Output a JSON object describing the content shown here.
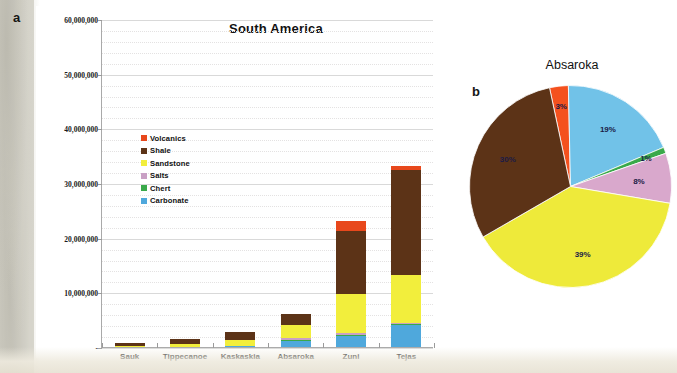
{
  "panels": {
    "a_letter": "a",
    "b_letter": "b"
  },
  "bar_panel": {
    "title": "South America",
    "legend_title": "",
    "legend": [
      {
        "label": "Volcanics",
        "color": "#e8481c"
      },
      {
        "label": "Shale",
        "color": "#5c3317"
      },
      {
        "label": "Sandstone",
        "color": "#f2ee3c"
      },
      {
        "label": "Salts",
        "color": "#c9a0c4"
      },
      {
        "label": "Chert",
        "color": "#3aa94a"
      },
      {
        "label": "Carbonate",
        "color": "#4fa8dc"
      }
    ]
  },
  "pie_panel": {
    "title": "Absaroka"
  },
  "chart_data": [
    {
      "type": "bar",
      "title": "South America",
      "stacked": true,
      "xlabel": "",
      "ylabel": "",
      "ylim": [
        0,
        60000000
      ],
      "ytick_values": [
        0,
        10000000,
        20000000,
        30000000,
        40000000,
        50000000,
        60000000
      ],
      "ytick_labels": [
        "-",
        "10,000,000",
        "20,000,000",
        "30,000,000",
        "40,000,000",
        "50,000,000",
        "60,000,000"
      ],
      "grid": true,
      "legend_position": "inside-upper-left",
      "categories": [
        "Sauk",
        "Tippecanoe",
        "Kaskaskia",
        "Absaroka",
        "Zuni",
        "Tejas"
      ],
      "series": [
        {
          "name": "Carbonate",
          "color": "#4fa8dc",
          "values": [
            0,
            0,
            200000,
            1100000,
            2000000,
            4000000
          ]
        },
        {
          "name": "Chert",
          "color": "#3aa94a",
          "values": [
            0,
            0,
            0,
            50000,
            80000,
            80000
          ]
        },
        {
          "name": "Salts",
          "color": "#c9a0c4",
          "values": [
            0,
            0,
            0,
            350000,
            500000,
            200000
          ]
        },
        {
          "name": "Sandstone",
          "color": "#f2ee3c",
          "values": [
            100000,
            600000,
            1100000,
            2400000,
            7000000,
            8900000
          ]
        },
        {
          "name": "Shale",
          "color": "#5c3317",
          "values": [
            600000,
            800000,
            1400000,
            2100000,
            11600000,
            19200000
          ]
        },
        {
          "name": "Volcanics",
          "color": "#e8481c",
          "values": [
            0,
            0,
            0,
            0,
            1800000,
            600000
          ]
        }
      ]
    },
    {
      "type": "pie",
      "title": "Absaroka",
      "labels": [
        "Volcanics",
        "Carbonate",
        "Chert",
        "Salts",
        "Sandstone",
        "Shale"
      ],
      "values": [
        3,
        19,
        1,
        8,
        39,
        30
      ],
      "display_labels": [
        "3%",
        "19%",
        "1%",
        "8%",
        "39%",
        "30%"
      ],
      "colors": [
        "#f4511e",
        "#71c2e8",
        "#3aa94a",
        "#d9a8cc",
        "#eeea3a",
        "#5c3317"
      ],
      "start_angle_deg": -12,
      "legend_position": "none"
    }
  ]
}
